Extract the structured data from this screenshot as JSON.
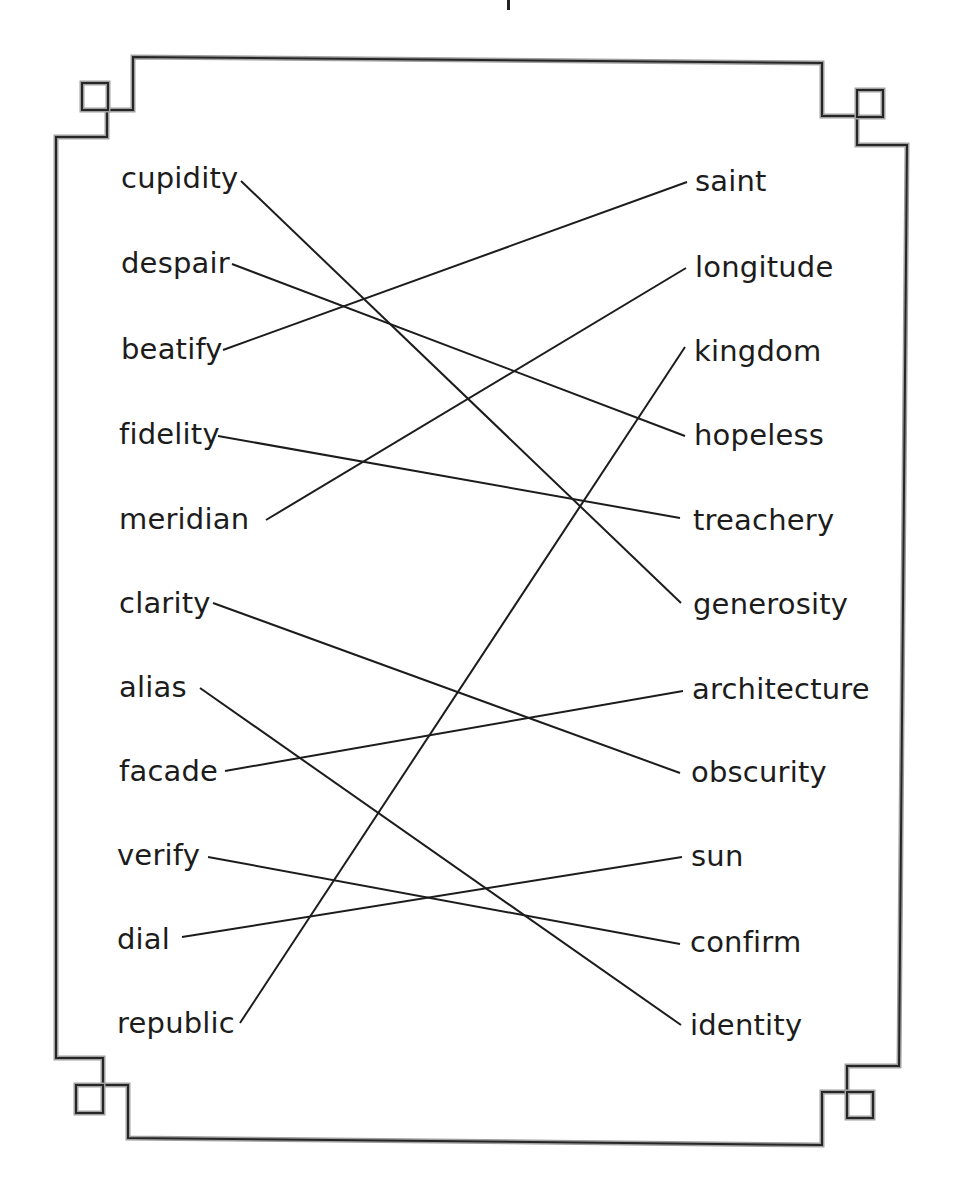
{
  "worksheet": {
    "title_fragment": "|",
    "left_words": [
      {
        "label": "cupidity",
        "x": 121,
        "y": 161,
        "anchor": [
          241,
          181
        ]
      },
      {
        "label": "despair",
        "x": 121,
        "y": 246,
        "anchor": [
          232,
          264
        ]
      },
      {
        "label": "beatify",
        "x": 121,
        "y": 332,
        "anchor": [
          223,
          350
        ]
      },
      {
        "label": "fidelity",
        "x": 119,
        "y": 417,
        "anchor": [
          218,
          436
        ]
      },
      {
        "label": "meridian",
        "x": 119,
        "y": 502,
        "anchor": [
          266,
          520
        ]
      },
      {
        "label": "clarity",
        "x": 119,
        "y": 586,
        "anchor": [
          213,
          603
        ]
      },
      {
        "label": "alias",
        "x": 119,
        "y": 670,
        "anchor": [
          200,
          688
        ]
      },
      {
        "label": "facade",
        "x": 119,
        "y": 754,
        "anchor": [
          225,
          771
        ]
      },
      {
        "label": "verify",
        "x": 117,
        "y": 838,
        "anchor": [
          208,
          857
        ]
      },
      {
        "label": "dial",
        "x": 117,
        "y": 922,
        "anchor": [
          182,
          937
        ]
      },
      {
        "label": "republic",
        "x": 117,
        "y": 1006,
        "anchor": [
          240,
          1023
        ]
      }
    ],
    "right_words": [
      {
        "label": "saint",
        "x": 695,
        "y": 164,
        "anchor": [
          687,
          182
        ]
      },
      {
        "label": "longitude",
        "x": 695,
        "y": 250,
        "anchor": [
          686,
          268
        ]
      },
      {
        "label": "kingdom",
        "x": 694,
        "y": 334,
        "anchor": [
          685,
          347
        ]
      },
      {
        "label": "hopeless",
        "x": 694,
        "y": 418,
        "anchor": [
          685,
          436
        ]
      },
      {
        "label": "treachery",
        "x": 693,
        "y": 503,
        "anchor": [
          680,
          518
        ]
      },
      {
        "label": "generosity",
        "x": 693,
        "y": 587,
        "anchor": [
          681,
          603
        ]
      },
      {
        "label": "architecture",
        "x": 692,
        "y": 672,
        "anchor": [
          683,
          691
        ]
      },
      {
        "label": "obscurity",
        "x": 691,
        "y": 755,
        "anchor": [
          680,
          773
        ]
      },
      {
        "label": "sun",
        "x": 691,
        "y": 839,
        "anchor": [
          682,
          857
        ]
      },
      {
        "label": "confirm",
        "x": 690,
        "y": 925,
        "anchor": [
          680,
          944
        ]
      },
      {
        "label": "identity",
        "x": 690,
        "y": 1008,
        "anchor": [
          681,
          1025
        ]
      }
    ],
    "matches": [
      {
        "left": "cupidity",
        "right": "generosity"
      },
      {
        "left": "despair",
        "right": "hopeless"
      },
      {
        "left": "beatify",
        "right": "saint"
      },
      {
        "left": "fidelity",
        "right": "treachery"
      },
      {
        "left": "meridian",
        "right": "longitude"
      },
      {
        "left": "clarity",
        "right": "obscurity"
      },
      {
        "left": "alias",
        "right": "identity"
      },
      {
        "left": "facade",
        "right": "architecture"
      },
      {
        "left": "verify",
        "right": "confirm"
      },
      {
        "left": "dial",
        "right": "sun"
      },
      {
        "left": "republic",
        "right": "kingdom"
      }
    ],
    "colors": {
      "ink": "#1c1c1c",
      "border_dark": "#2a2a2a",
      "border_light": "#9a9a9a",
      "background": "#ffffff"
    }
  }
}
